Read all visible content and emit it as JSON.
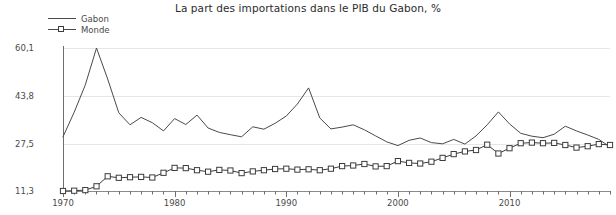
{
  "chart_data": {
    "type": "line",
    "title": "La part des importations dans le PIB du Gabon, %",
    "xlabel": "",
    "ylabel": "",
    "grid": true,
    "legend_position": "top-left",
    "ylim": [
      11.3,
      60.1
    ],
    "xlim": [
      1970,
      2019
    ],
    "ytick_labels": [
      "60,1",
      "43,8",
      "27,5",
      "11,3"
    ],
    "ytick_values": [
      60.1,
      43.8,
      27.5,
      11.3
    ],
    "xtick_labels": [
      "1970",
      "1980",
      "1990",
      "2000",
      "2010"
    ],
    "xtick_values": [
      1970,
      1980,
      1990,
      2000,
      2010
    ],
    "x": [
      1970,
      1971,
      1972,
      1973,
      1974,
      1975,
      1976,
      1977,
      1978,
      1979,
      1980,
      1981,
      1982,
      1983,
      1984,
      1985,
      1986,
      1987,
      1988,
      1989,
      1990,
      1991,
      1992,
      1993,
      1994,
      1995,
      1996,
      1997,
      1998,
      1999,
      2000,
      2001,
      2002,
      2003,
      2004,
      2005,
      2006,
      2007,
      2008,
      2009,
      2010,
      2011,
      2012,
      2013,
      2014,
      2015,
      2016,
      2017,
      2018,
      2019
    ],
    "series": [
      {
        "name": "Gabon",
        "marker": "none",
        "color": "#4a4a4a",
        "values": [
          29.8,
          38.2,
          47.5,
          60.1,
          49.5,
          38.0,
          33.9,
          36.4,
          34.6,
          31.8,
          36.0,
          34.0,
          37.2,
          32.8,
          31.3,
          30.5,
          29.8,
          33.2,
          32.4,
          34.4,
          36.9,
          41.0,
          46.5,
          36.2,
          32.5,
          33.1,
          33.9,
          32.2,
          30.1,
          28.1,
          26.8,
          28.6,
          29.4,
          27.8,
          27.4,
          28.9,
          27.3,
          30.1,
          33.9,
          38.3,
          34.2,
          31.0,
          30.0,
          29.5,
          30.7,
          33.4,
          31.8,
          30.4,
          28.9,
          26.4
        ]
      },
      {
        "name": "Monde",
        "marker": "square",
        "color": "#3c3c3c",
        "values": [
          11.3,
          11.4,
          11.6,
          12.9,
          16.3,
          15.8,
          16.0,
          16.1,
          15.9,
          17.5,
          19.2,
          19.1,
          18.4,
          17.9,
          18.5,
          18.3,
          17.4,
          18.0,
          18.4,
          18.8,
          18.9,
          18.6,
          18.7,
          18.4,
          18.9,
          19.8,
          20.0,
          20.5,
          19.7,
          19.8,
          21.5,
          20.9,
          20.7,
          21.3,
          22.6,
          23.9,
          24.8,
          25.3,
          27.1,
          24.1,
          25.9,
          27.6,
          27.8,
          27.6,
          27.7,
          27.0,
          26.1,
          26.6,
          27.3,
          27.0
        ]
      }
    ]
  },
  "legend": {
    "items": [
      {
        "label": "Gabon"
      },
      {
        "label": "Monde"
      }
    ]
  }
}
